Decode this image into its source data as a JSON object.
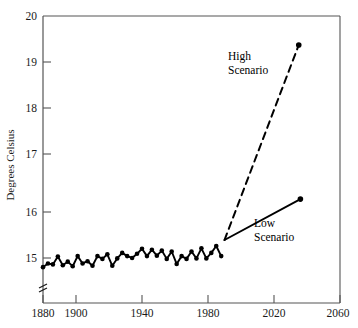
{
  "chart_data": {
    "type": "line",
    "title": "",
    "xlabel": "",
    "ylabel": "Degrees Celsius",
    "xlim": [
      1880,
      2060
    ],
    "ylim": [
      14.4,
      20
    ],
    "grid": false,
    "legend_position": "inline-annotations",
    "y_ticks": [
      "20",
      "19",
      "18",
      "17",
      "16",
      "15"
    ],
    "y_tick_values": [
      20,
      19,
      18,
      17,
      16,
      15
    ],
    "x_ticks": [
      "1880",
      "1900",
      "1940",
      "1980",
      "2020",
      "2060"
    ],
    "x_tick_values": [
      1880,
      1900,
      1940,
      1980,
      2020,
      2060
    ],
    "y_axis_break": true,
    "annotations": [
      {
        "name": "high-scenario-label",
        "text_line1": "High",
        "text_line2": "Scenario",
        "x": 2000,
        "y": 18.85
      },
      {
        "name": "low-scenario-label",
        "text_line1": "Low",
        "text_line2": "Scenario",
        "x": 2008,
        "y": 15.55
      }
    ],
    "series": [
      {
        "name": "Observed",
        "style": "solid",
        "markers": true,
        "x": [
          1880,
          1883,
          1886,
          1889,
          1892,
          1895,
          1898,
          1901,
          1904,
          1907,
          1910,
          1913,
          1916,
          1919,
          1922,
          1925,
          1928,
          1931,
          1934,
          1937,
          1940,
          1943,
          1946,
          1949,
          1952,
          1955,
          1958,
          1961,
          1964,
          1967,
          1970,
          1973,
          1976,
          1979,
          1982,
          1985,
          1988
        ],
        "values": [
          14.54,
          14.62,
          14.6,
          14.77,
          14.58,
          14.66,
          14.56,
          14.78,
          14.62,
          14.67,
          14.57,
          14.78,
          14.72,
          14.82,
          14.57,
          14.73,
          14.85,
          14.78,
          14.74,
          14.83,
          14.94,
          14.78,
          14.92,
          14.79,
          14.9,
          14.72,
          14.88,
          14.61,
          14.78,
          14.72,
          14.88,
          14.73,
          14.95,
          14.73,
          14.85,
          15.0,
          14.78
        ]
      },
      {
        "name": "High Scenario",
        "style": "dashed",
        "markers": false,
        "endpoint_marker": true,
        "x": [
          1990,
          2035
        ],
        "values": [
          15.13,
          19.37
        ]
      },
      {
        "name": "Low Scenario",
        "style": "solid",
        "markers": false,
        "endpoint_marker": true,
        "x": [
          1990,
          2036
        ],
        "values": [
          15.13,
          16.02
        ]
      }
    ]
  },
  "axis": {
    "y_title": "Degrees Celsius"
  }
}
